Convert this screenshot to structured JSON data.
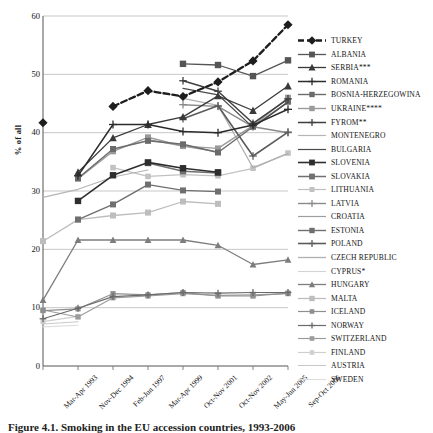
{
  "chart_data": {
    "type": "line",
    "title": "",
    "xlabel": "",
    "ylabel": "% of all",
    "ylim": [
      0,
      60
    ],
    "yticks": [
      0,
      10,
      20,
      30,
      40,
      50,
      60
    ],
    "grid": "horizontal",
    "legend_position": "right",
    "categories": [
      "Mar-Apr 1993",
      "Nov-Dec 1994",
      "Feb-Jun 1997",
      "Mar-Apr 1999",
      "Oct-Nov 2001",
      "Oct-Nov 2002",
      "May-Jun 2005",
      "Sep-Oct 2006"
    ],
    "series": [
      {
        "name": "TURKEY",
        "values": [
          41.7,
          null,
          44.5,
          47.2,
          46.2,
          48.7,
          52.3,
          58.5
        ],
        "color": "#1d1d1d",
        "width": 2.3,
        "dash": "6,3",
        "marker": "diamond",
        "msize": 4.0
      },
      {
        "name": "ALBANIA",
        "values": [
          null,
          null,
          null,
          null,
          51.8,
          51.6,
          49.7,
          52.4
        ],
        "color": "#555555",
        "width": 1.3,
        "dash": "",
        "marker": "square",
        "msize": 3.2
      },
      {
        "name": "SERBIA***",
        "values": [
          null,
          33.2,
          39.1,
          41.4,
          42.7,
          46.3,
          43.8,
          48.0
        ],
        "color": "#3a3a3a",
        "width": 1.3,
        "dash": "",
        "marker": "triangle",
        "msize": 3.4
      },
      {
        "name": "ROMANIA",
        "values": [
          null,
          32.6,
          41.4,
          41.4,
          40.2,
          40.0,
          41.3,
          44.0
        ],
        "color": "#2b2b2b",
        "width": 1.5,
        "dash": "",
        "marker": "plus",
        "msize": 3.2
      },
      {
        "name": "BOSNIA-HERZEGOWINA",
        "values": [
          null,
          32.2,
          37.2,
          38.6,
          38.0,
          36.6,
          41.0,
          45.3
        ],
        "color": "#6b6b6b",
        "width": 1.4,
        "dash": "",
        "marker": "square",
        "msize": 3.0
      },
      {
        "name": "UKRAINE****",
        "values": [
          null,
          32.1,
          36.8,
          39.2,
          37.7,
          37.3,
          41.2,
          46.0
        ],
        "color": "#9a9a9a",
        "width": 1.4,
        "dash": "",
        "marker": "square",
        "msize": 3.0
      },
      {
        "name": "FYROM**",
        "values": [
          null,
          null,
          null,
          null,
          48.9,
          47.1,
          41.6,
          45.8
        ],
        "color": "#3f3f3f",
        "width": 1.5,
        "dash": "",
        "marker": "plus",
        "msize": 3.0
      },
      {
        "name": "MONTENEGRO",
        "values": [
          28.9,
          30.3,
          32.4,
          33.6,
          null,
          null,
          null,
          null
        ],
        "color": "#b5b5b5",
        "width": 1.2,
        "dash": "",
        "marker": "none",
        "msize": 0
      },
      {
        "name": "BULGARIA",
        "values": [
          null,
          null,
          null,
          null,
          47.6,
          46.5,
          40.9,
          45.2
        ],
        "color": "#4a4a4a",
        "width": 1.2,
        "dash": "",
        "marker": "none",
        "msize": 0
      },
      {
        "name": "SLOVENIA",
        "values": [
          null,
          28.3,
          32.7,
          34.9,
          33.9,
          33.2,
          null,
          null
        ],
        "color": "#2e2e2e",
        "width": 1.6,
        "dash": "",
        "marker": "square",
        "msize": 3.2
      },
      {
        "name": "SLOVAKIA",
        "values": [
          null,
          null,
          null,
          34.8,
          33.4,
          33.1,
          null,
          null
        ],
        "color": "#707070",
        "width": 1.5,
        "dash": "",
        "marker": "square",
        "msize": 3.2
      },
      {
        "name": "LITHUANIA",
        "values": [
          null,
          null,
          34.0,
          32.5,
          32.8,
          32.6,
          33.9,
          36.5
        ],
        "color": "#c2c2c2",
        "width": 1.3,
        "dash": "",
        "marker": "square",
        "msize": 2.8
      },
      {
        "name": "LATVIA",
        "values": [
          null,
          null,
          null,
          null,
          44.8,
          44.5,
          41.0,
          40.0
        ],
        "color": "#8a8a8a",
        "width": 1.4,
        "dash": "",
        "marker": "plus",
        "msize": 3.0
      },
      {
        "name": "CROATIA",
        "values": [
          null,
          null,
          null,
          38.8,
          37.7,
          36.7,
          null,
          null
        ],
        "color": "#9e9e9e",
        "width": 1.2,
        "dash": "",
        "marker": "none",
        "msize": 0
      },
      {
        "name": "ESTONIA",
        "values": [
          null,
          25.1,
          27.7,
          31.1,
          30.1,
          29.9,
          null,
          null
        ],
        "color": "#6f6f6f",
        "width": 1.4,
        "dash": "",
        "marker": "square",
        "msize": 3.0
      },
      {
        "name": "POLAND",
        "values": [
          null,
          null,
          null,
          null,
          42.4,
          44.6,
          36.0,
          40.1
        ],
        "color": "#5c5c5c",
        "width": 1.6,
        "dash": "",
        "marker": "plus",
        "msize": 3.0
      },
      {
        "name": "CZECH REPUBLIC",
        "values": [
          null,
          null,
          null,
          null,
          45.9,
          44.7,
          34.0,
          36.4
        ],
        "color": "#b0b0b0",
        "width": 1.3,
        "dash": "",
        "marker": "none",
        "msize": 0
      },
      {
        "name": "CYPRUS*",
        "values": [
          null,
          null,
          null,
          null,
          null,
          null,
          null,
          null
        ],
        "color": "#d4d4d4",
        "width": 1.1,
        "dash": "",
        "marker": "none",
        "msize": 0
      },
      {
        "name": "HUNGARY",
        "values": [
          11.3,
          21.6,
          21.6,
          21.6,
          21.6,
          20.7,
          17.4,
          18.2
        ],
        "color": "#7d7d7d",
        "width": 1.3,
        "dash": "",
        "marker": "triangle",
        "msize": 3.0
      },
      {
        "name": "MALTA",
        "values": [
          21.4,
          25.1,
          25.8,
          26.3,
          28.2,
          27.8,
          null,
          null
        ],
        "color": "#bdbdbd",
        "width": 1.3,
        "dash": "",
        "marker": "square",
        "msize": 3.0
      },
      {
        "name": "ICELAND",
        "values": [
          9.5,
          9.8,
          12.4,
          12.2,
          12.6,
          12.0,
          12.0,
          12.5
        ],
        "color": "#8f8f8f",
        "width": 1.2,
        "dash": "",
        "marker": "square",
        "msize": 2.6
      },
      {
        "name": "NORWAY",
        "values": [
          8.1,
          9.9,
          11.9,
          12.2,
          12.6,
          12.5,
          12.6,
          12.6
        ],
        "color": "#6a6a6a",
        "width": 1.2,
        "dash": "",
        "marker": "plus",
        "msize": 2.6
      },
      {
        "name": "SWITZERLAND",
        "values": [
          9.6,
          8.4,
          11.7,
          12.0,
          12.4,
          12.1,
          12.2,
          12.4
        ],
        "color": "#9c9c9c",
        "width": 1.2,
        "dash": "",
        "marker": "square",
        "msize": 2.6
      },
      {
        "name": "FINLAND",
        "values": [
          7.6,
          8.5,
          null,
          null,
          null,
          null,
          null,
          null
        ],
        "color": "#cfcfcf",
        "width": 1.2,
        "dash": "",
        "marker": "square",
        "msize": 2.6
      },
      {
        "name": "AUSTRIA",
        "values": [
          7.2,
          7.6,
          null,
          null,
          null,
          null,
          null,
          null
        ],
        "color": "#c9c9c9",
        "width": 1.1,
        "dash": "",
        "marker": "none",
        "msize": 0
      },
      {
        "name": "SWEDEN",
        "values": [
          6.7,
          7.0,
          null,
          null,
          null,
          null,
          null,
          null
        ],
        "color": "#dddddd",
        "width": 1.1,
        "dash": "",
        "marker": "none",
        "msize": 0
      }
    ]
  },
  "caption": "Figure 4.1. Smoking in the EU accession countries, 1993-2006"
}
